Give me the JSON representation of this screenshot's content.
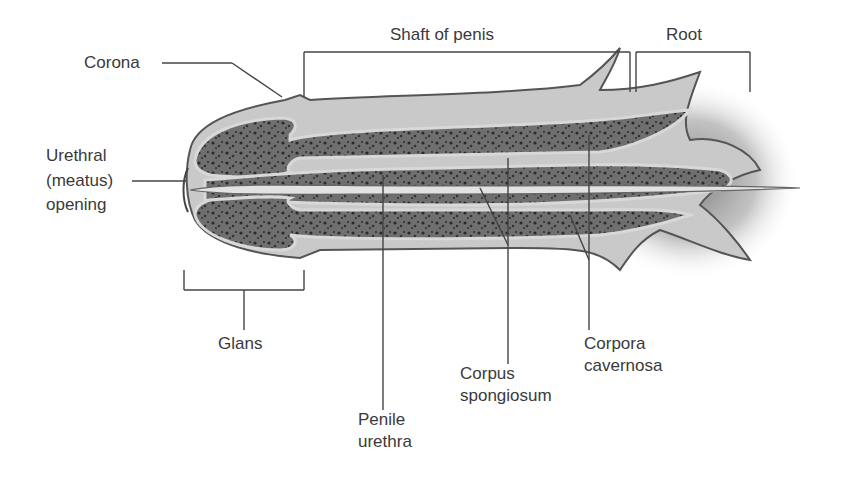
{
  "diagram": {
    "labels": {
      "corona": "Corona",
      "urethral_opening_line1": "Urethral",
      "urethral_opening_line2": "(meatus)",
      "urethral_opening_line3": "opening",
      "shaft": "Shaft of penis",
      "root": "Root",
      "glans": "Glans",
      "penile_urethra_line1": "Penile",
      "penile_urethra_line2": "urethra",
      "corpus_spongiosum_line1": "Corpus",
      "corpus_spongiosum_line2": "spongiosum",
      "corpora_cavernosa_line1": "Corpora",
      "corpora_cavernosa_line2": "cavernosa"
    },
    "colors": {
      "tissue_dark": "#4a4a4a",
      "tissue_mid": "#7d7d7d",
      "sheath_light": "#c8c8c8",
      "background": "#ffffff",
      "label_text": "#3a3a3a"
    }
  }
}
